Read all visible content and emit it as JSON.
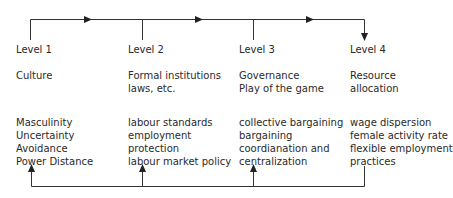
{
  "levels": [
    {
      "label": "Level 1",
      "heading": [
        "Culture"
      ],
      "items": [
        "Masculinity",
        "Uncertainty",
        "Avoidance",
        "Power Distance"
      ]
    },
    {
      "label": "Level 2",
      "heading": [
        "Formal institutions",
        "laws, etc."
      ],
      "items": [
        "labour standards",
        "employment",
        "protection",
        "labour market policy"
      ]
    },
    {
      "label": "Level 3",
      "heading": [
        "Governance",
        "Play of the game"
      ],
      "items": [
        "collective bargaining",
        "bargaining",
        "coordianation and",
        "centralization"
      ]
    },
    {
      "label": "Level 4",
      "heading": [
        "Resource",
        "allocation"
      ],
      "items": [
        "wage dispersion",
        "female activity rate",
        "flexible employment",
        "practices"
      ]
    }
  ],
  "colors": {
    "line": "#333333",
    "text": "#2a2a2a"
  }
}
